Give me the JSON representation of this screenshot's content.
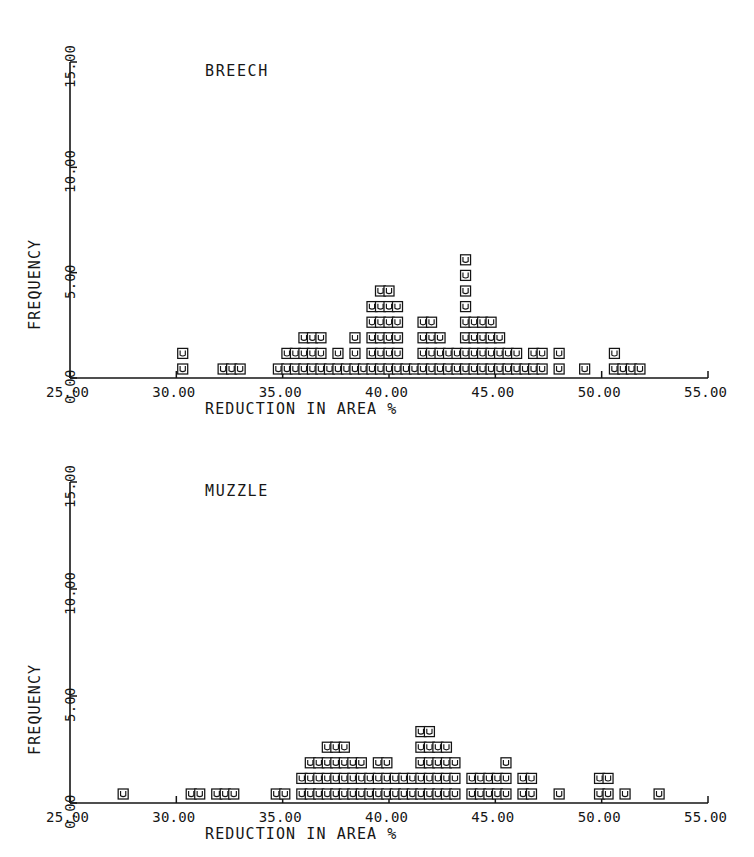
{
  "figure": {
    "background_color": "#ffffff",
    "ink_color": "#141414",
    "marker_glyph": "square-with-u"
  },
  "chart_data": [
    {
      "type": "scatter",
      "plot_name": "breech",
      "title": "BREECH",
      "xlabel": "REDUCTION IN AREA %",
      "ylabel": "FREQUENCY",
      "xlim": [
        25.0,
        55.0
      ],
      "ylim": [
        0.0,
        15.0
      ],
      "xticks": [
        "25.00",
        "30.00",
        "35.00",
        "40.00",
        "45.00",
        "50.00",
        "55.00"
      ],
      "xtick_values": [
        25.0,
        30.0,
        35.0,
        40.0,
        45.0,
        50.0,
        55.0
      ],
      "yticks": [
        "0.00",
        "5.00",
        "10.00",
        "15.00"
      ],
      "ytick_values": [
        0.0,
        5.0,
        10.0,
        15.0
      ],
      "grid": false,
      "legend": false,
      "note": "Dot plot: each marker is one observation stacked at its x bin; values are counts per bin",
      "x": [
        30.3,
        32.2,
        32.6,
        33.0,
        34.8,
        35.2,
        35.6,
        36.0,
        36.4,
        36.8,
        37.2,
        37.6,
        38.0,
        38.4,
        38.8,
        39.2,
        39.6,
        40.0,
        40.4,
        40.8,
        41.2,
        41.6,
        42.0,
        42.4,
        42.8,
        43.2,
        43.6,
        44.0,
        44.4,
        44.8,
        45.2,
        45.6,
        46.0,
        46.4,
        46.8,
        47.2,
        48.0,
        49.2,
        50.6,
        51.0,
        51.4,
        51.8
      ],
      "counts": [
        2,
        1,
        1,
        1,
        1,
        2,
        2,
        3,
        3,
        3,
        1,
        2,
        1,
        3,
        1,
        5,
        6,
        6,
        5,
        1,
        1,
        4,
        4,
        3,
        2,
        2,
        8,
        4,
        4,
        4,
        3,
        2,
        2,
        1,
        2,
        2,
        2,
        1,
        2,
        1,
        1,
        1
      ]
    },
    {
      "type": "scatter",
      "plot_name": "muzzle",
      "title": "MUZZLE",
      "xlabel": "REDUCTION IN AREA %",
      "ylabel": "FREQUENCY",
      "xlim": [
        25.0,
        55.0
      ],
      "ylim": [
        0.0,
        15.0
      ],
      "xticks": [
        "25.00",
        "30.00",
        "35.00",
        "40.00",
        "45.00",
        "50.00",
        "55.00"
      ],
      "xtick_values": [
        25.0,
        30.0,
        35.0,
        40.0,
        45.0,
        50.0,
        55.0
      ],
      "yticks": [
        "0.00",
        "5.00",
        "10.00",
        "15.00"
      ],
      "ytick_values": [
        0.0,
        5.0,
        10.0,
        15.0
      ],
      "grid": false,
      "legend": false,
      "note": "Dot plot: each marker is one observation stacked at its x bin; values are counts per bin",
      "x": [
        27.5,
        30.7,
        31.1,
        31.9,
        32.3,
        32.7,
        34.7,
        35.1,
        35.9,
        36.3,
        36.7,
        37.1,
        37.5,
        37.9,
        38.3,
        38.7,
        39.1,
        39.5,
        39.9,
        40.3,
        40.7,
        41.1,
        41.5,
        41.9,
        42.3,
        42.7,
        43.1,
        43.9,
        44.3,
        44.7,
        45.1,
        45.5,
        46.3,
        46.7,
        48.0,
        49.9,
        50.3,
        51.1,
        52.7
      ],
      "counts": [
        1,
        1,
        1,
        1,
        1,
        1,
        1,
        1,
        2,
        3,
        3,
        4,
        4,
        4,
        3,
        3,
        2,
        3,
        3,
        2,
        2,
        2,
        5,
        5,
        4,
        4,
        3,
        2,
        2,
        2,
        2,
        3,
        2,
        2,
        1,
        2,
        2,
        1,
        1
      ]
    }
  ]
}
